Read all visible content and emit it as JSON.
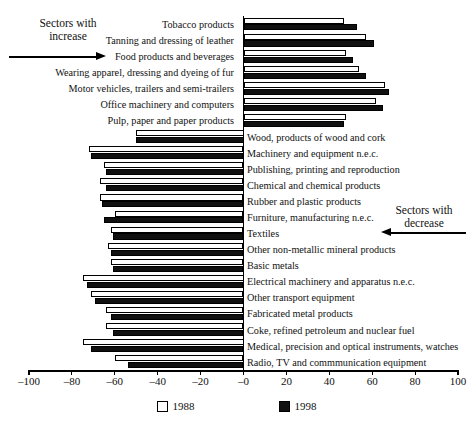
{
  "title_faint": "",
  "annotations": {
    "increase": "Sectors with\nincrease",
    "increase_line1": "Sectors with",
    "increase_line2": "increase",
    "decrease_line1": "Sectors with",
    "decrease_line2": "decrease"
  },
  "legend": [
    {
      "label": "1988",
      "swatch": "open",
      "color": "#ffffff"
    },
    {
      "label": "1998",
      "swatch": "filled",
      "color": "#111111"
    }
  ],
  "chart_data": {
    "type": "bar",
    "orientation": "horizontal",
    "title": "",
    "xlabel": "",
    "ylabel": "",
    "xlim": [
      -100,
      100
    ],
    "grid": false,
    "legend_position": "bottom",
    "tick_labels": [
      "-100",
      "-80",
      "-60",
      "-40",
      "-20",
      "-0",
      "20",
      "40",
      "60",
      "80",
      "100"
    ],
    "tick_values": [
      -100,
      -80,
      -60,
      -40,
      -20,
      0,
      20,
      40,
      60,
      80,
      100
    ],
    "categories": [
      "Tobacco products",
      "Tanning and dressing of leather",
      "Food products and beverages",
      "Wearing apparel, dressing and dyeing of fur",
      "Motor vehicles, trailers and semi-trailers",
      "Office machinery and computers",
      "Pulp, paper and paper products",
      "Wood, products of wood and cork",
      "Machinery and equipment n.e.c.",
      "Publishing, printing and reproduction",
      "Chemical and chemical products",
      "Rubber and plastic products",
      "Furniture, manufacturing n.e.c.",
      "Textiles",
      "Other non-metallic mineral products",
      "Basic metals",
      "Electrical machinery and apparatus n.e.c.",
      "Other transport equipment",
      "Fabricated metal products",
      "Coke, refined petroleum and nuclear fuel",
      "Medical, precision and optical instruments, watches",
      "Radio, TV and commmunication equipment"
    ],
    "label_side": [
      "left",
      "left",
      "left",
      "left",
      "left",
      "left",
      "left",
      "right",
      "right",
      "right",
      "right",
      "right",
      "right",
      "right",
      "right",
      "right",
      "right",
      "right",
      "right",
      "right",
      "right",
      "right"
    ],
    "series": [
      {
        "name": "1988",
        "values": [
          47,
          57,
          48,
          54,
          66,
          62,
          48,
          -50,
          -72,
          -65,
          -67,
          -67,
          -60,
          -62,
          -63,
          -62,
          -75,
          -71,
          -64,
          -64,
          -75,
          -60
        ]
      },
      {
        "name": "1998",
        "values": [
          53,
          61,
          51,
          57,
          68,
          65,
          47,
          -50,
          -71,
          -64,
          -64,
          -66,
          -65,
          -61,
          -62,
          -61,
          -73,
          -69,
          -62,
          -61,
          -71,
          -54
        ]
      }
    ]
  }
}
